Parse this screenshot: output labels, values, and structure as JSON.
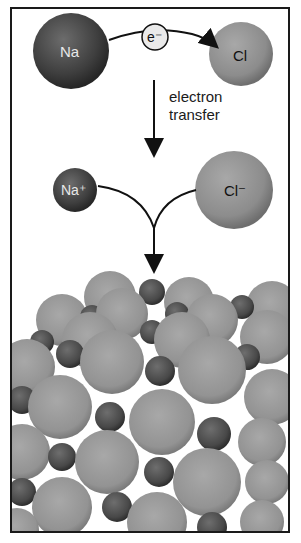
{
  "diagram": {
    "title": "",
    "atoms": {
      "na": {
        "label": "Na",
        "color": "#4a4a4a"
      },
      "cl": {
        "label": "Cl",
        "color": "#8f8f8f"
      }
    },
    "electron": {
      "label": "e⁻"
    },
    "step_label": {
      "line1": "electron",
      "line2": "transfer"
    },
    "ions": {
      "na_ion": {
        "label": "Na⁺",
        "color": "#4a4a4a"
      },
      "cl_ion": {
        "label": "Cl⁻",
        "color": "#8f8f8f"
      }
    },
    "lattice": {
      "description": "NaCl crystal lattice",
      "large_color": "#9a9a9a",
      "small_color": "#575757"
    }
  }
}
